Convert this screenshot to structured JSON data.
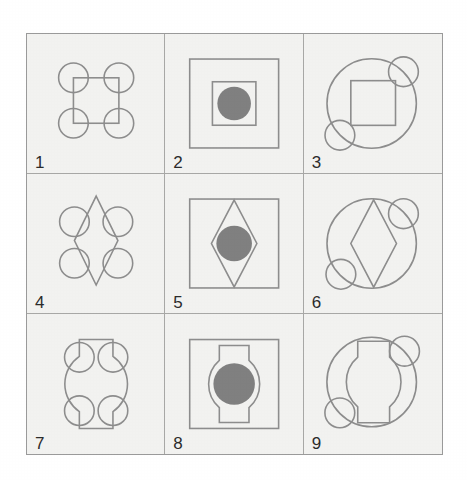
{
  "figure": {
    "kind": "matrix-reasoning-puzzle",
    "rows": 3,
    "columns": 3,
    "background_color": "#ffffff",
    "cell_fill_color": "#f2f2f0",
    "grid_line_color": "#a8a8a6",
    "frame_color": "#9a9a9a",
    "shape_stroke_color": "#8d8d8d",
    "dot_fill_color": "#808080",
    "number_color": "#2b2b2b"
  },
  "cells": [
    {
      "number": "1",
      "row": 1,
      "column": 1,
      "inner_shape": "square",
      "decoration": "four-corner-circles",
      "filled_center_dot": false,
      "description": "Square outline with four circle outlines centered on its corners"
    },
    {
      "number": "2",
      "row": 1,
      "column": 2,
      "inner_shape": "square",
      "decoration": "outer-square",
      "filled_center_dot": true,
      "description": "Large square outline containing a smaller square outline with a filled gray circle in the center"
    },
    {
      "number": "3",
      "row": 1,
      "column": 3,
      "inner_shape": "square",
      "decoration": "big-circle-two-small-circles",
      "filled_center_dot": false,
      "description": "Large circle outline containing a square outline, with small circles on the upper-right and lower-left of the circle edge"
    },
    {
      "number": "4",
      "row": 2,
      "column": 1,
      "inner_shape": "diamond",
      "decoration": "four-corner-circles",
      "filled_center_dot": false,
      "description": "Diamond outline with four circle outlines at the four corner positions"
    },
    {
      "number": "5",
      "row": 2,
      "column": 2,
      "inner_shape": "diamond",
      "decoration": "outer-square",
      "filled_center_dot": true,
      "description": "Large square outline containing a diamond outline with a filled gray circle in the center"
    },
    {
      "number": "6",
      "row": 2,
      "column": 3,
      "inner_shape": "diamond",
      "decoration": "big-circle-two-small-circles",
      "filled_center_dot": false,
      "description": "Large circle outline containing a diamond outline, with small circles on the upper-right and lower-left of the circle edge"
    },
    {
      "number": "7",
      "row": 3,
      "column": 1,
      "inner_shape": "barrel",
      "decoration": "four-corner-circles",
      "filled_center_dot": false,
      "description": "Barrel shape (flat top and bottom, bulging sides) with four circle outlines at the four corner positions"
    },
    {
      "number": "8",
      "row": 3,
      "column": 2,
      "inner_shape": "barrel",
      "decoration": "outer-square",
      "filled_center_dot": true,
      "description": "Large square outline containing a barrel shape with a filled gray circle in the center"
    },
    {
      "number": "9",
      "row": 3,
      "column": 3,
      "inner_shape": "barrel",
      "decoration": "big-circle-two-small-circles",
      "filled_center_dot": false,
      "description": "Large circle outline containing a barrel shape, with small circles on the upper-right and lower-left of the circle edge"
    }
  ]
}
